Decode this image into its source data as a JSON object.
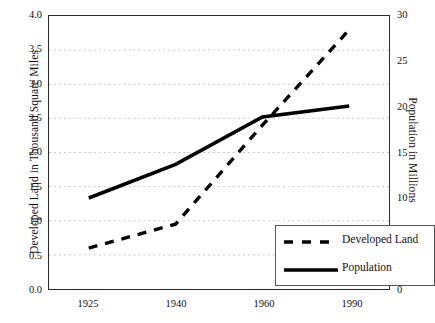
{
  "chart_data": {
    "type": "line",
    "title": "",
    "xlabel": "",
    "ylabel": "Developed Land in Thousand Square Miles",
    "y2label": "Population in Millions",
    "categories": [
      "1925",
      "1940",
      "1960",
      "1990"
    ],
    "ylim": [
      0.0,
      4.0
    ],
    "y2lim": [
      0,
      30
    ],
    "yticks": [
      "0.0",
      "0.5",
      "1.0",
      "1.5",
      "2.0",
      "2.5",
      "3.0",
      "3.5",
      "4.0"
    ],
    "y2ticks": [
      "0",
      "5",
      "10",
      "15",
      "20",
      "25",
      "30"
    ],
    "grid": true,
    "legend_position": "lower right",
    "series": [
      {
        "name": "Developed Land",
        "axis": "left",
        "style": "dashed",
        "color": "#000000",
        "values": [
          0.6,
          0.95,
          2.4,
          3.8
        ]
      },
      {
        "name": "Population",
        "axis": "right",
        "style": "solid",
        "color": "#000000",
        "values": [
          10.0,
          13.7,
          18.9,
          20.1
        ],
        "values_left_scale": [
          1.33,
          1.82,
          2.52,
          2.68
        ]
      }
    ]
  },
  "axes": {
    "left_title": "Developed Land in Thousand Square Miles",
    "right_title": "Population in Millions",
    "y_left_ticks": [
      "4.0",
      "3.5",
      "3.0",
      "2.5",
      "2.0",
      "1.5",
      "1.0",
      "0.5",
      "0.0"
    ],
    "y_right_ticks": [
      "30",
      "25",
      "20",
      "15",
      "10",
      "5",
      "0"
    ],
    "x_ticks": [
      "1925",
      "1940",
      "1960",
      "1990"
    ]
  },
  "legend": {
    "items": [
      {
        "label": "Developed Land",
        "style": "dashed"
      },
      {
        "label": "Population",
        "style": "solid"
      }
    ]
  }
}
